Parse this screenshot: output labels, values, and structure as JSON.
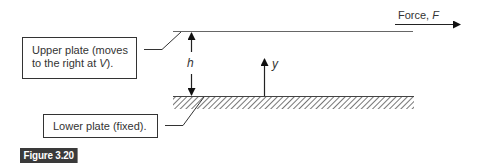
{
  "figure": {
    "caption": "Figure 3.20",
    "badge_color": "#3a3a3a"
  },
  "labels": {
    "upper_plate": {
      "line1": "Upper plate (moves",
      "line2_prefix": "to the right at ",
      "line2_var": "V",
      "line2_suffix": ")."
    },
    "lower_plate": {
      "text": "Lower plate (fixed)."
    },
    "force": {
      "prefix": "Force, ",
      "var": "F"
    },
    "gap_height": "h",
    "y_axis": "y"
  },
  "colors": {
    "line": "#333333",
    "plate_line": "#666666",
    "hatch": "#777777"
  }
}
